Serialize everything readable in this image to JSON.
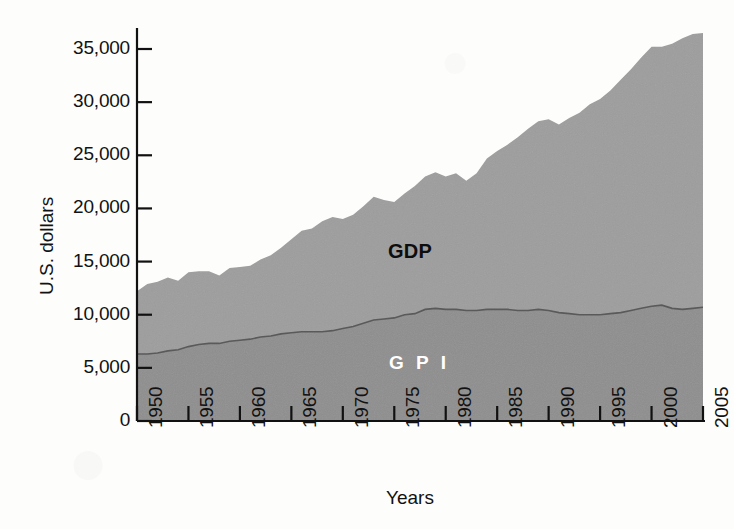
{
  "figure": {
    "background_color": "#fdfdfc",
    "axis_color": "#111111"
  },
  "axes": {
    "y_title": "U.S. dollars",
    "x_title": "Years",
    "y_ticks": [
      "0",
      "5,000",
      "10,000",
      "15,000",
      "20,000",
      "25,000",
      "30,000",
      "35,000"
    ],
    "x_ticks": [
      "1950",
      "1955",
      "1960",
      "1965",
      "1970",
      "1975",
      "1980",
      "1985",
      "1990",
      "1995",
      "2000",
      "2005"
    ]
  },
  "series_labels": {
    "gdp": "GDP",
    "gpi": "G P I"
  },
  "colors": {
    "gdp_band": "#9d9d9d",
    "gpi_band": "#8e8e8e",
    "gpi_line": "#5c5c5c",
    "axis": "#111111",
    "gdp_text": "#0d0d0d",
    "gpi_text": "#ffffff"
  },
  "chart_data": {
    "type": "area",
    "title": "",
    "subtitle": "",
    "xlabel": "Years",
    "ylabel": "U.S. dollars",
    "units": "U.S. dollars per capita",
    "stacked": false,
    "grid": false,
    "legend": "inline-labels",
    "xlim": [
      1950,
      2005
    ],
    "ylim": [
      0,
      36500
    ],
    "y_tick_values": [
      0,
      5000,
      10000,
      15000,
      20000,
      25000,
      30000,
      35000
    ],
    "x_tick_values": [
      1950,
      1955,
      1960,
      1965,
      1970,
      1975,
      1980,
      1985,
      1990,
      1995,
      2000,
      2005
    ],
    "x": [
      1950,
      1951,
      1952,
      1953,
      1954,
      1955,
      1956,
      1957,
      1958,
      1959,
      1960,
      1961,
      1962,
      1963,
      1964,
      1965,
      1966,
      1967,
      1968,
      1969,
      1970,
      1971,
      1972,
      1973,
      1974,
      1975,
      1976,
      1977,
      1978,
      1979,
      1980,
      1981,
      1982,
      1983,
      1984,
      1985,
      1986,
      1987,
      1988,
      1989,
      1990,
      1991,
      1992,
      1993,
      1994,
      1995,
      1996,
      1997,
      1998,
      1999,
      2000,
      2001,
      2002,
      2003,
      2004,
      2005
    ],
    "series": [
      {
        "name": "GDP",
        "label": "GDP",
        "color": "#9d9d9d",
        "values": [
          12200,
          12900,
          13100,
          13500,
          13200,
          14000,
          14100,
          14100,
          13700,
          14400,
          14500,
          14600,
          15200,
          15600,
          16300,
          17100,
          17900,
          18100,
          18800,
          19200,
          19000,
          19400,
          20200,
          21100,
          20800,
          20600,
          21400,
          22100,
          23000,
          23400,
          23000,
          23300,
          22600,
          23300,
          24700,
          25400,
          26000,
          26700,
          27500,
          28200,
          28400,
          27900,
          28500,
          29000,
          29800,
          30300,
          31100,
          32100,
          33100,
          34200,
          35200,
          35200,
          35500,
          36000,
          36400,
          36500
        ]
      },
      {
        "name": "GPI",
        "label": "G P I",
        "color": "#8e8e8e",
        "values": [
          6300,
          6300,
          6400,
          6600,
          6700,
          7000,
          7200,
          7300,
          7300,
          7500,
          7600,
          7700,
          7900,
          8000,
          8200,
          8300,
          8400,
          8400,
          8400,
          8500,
          8700,
          8900,
          9200,
          9500,
          9600,
          9700,
          10000,
          10100,
          10500,
          10600,
          10500,
          10500,
          10400,
          10400,
          10500,
          10500,
          10500,
          10400,
          10400,
          10500,
          10400,
          10200,
          10100,
          10000,
          10000,
          10000,
          10100,
          10200,
          10400,
          10600,
          10800,
          10900,
          10600,
          10500,
          10600,
          10700
        ]
      }
    ],
    "annotations": [
      {
        "text": "GDP",
        "x": 1978,
        "y": 16500,
        "style": "bold-black"
      },
      {
        "text": "G P I",
        "x": 1978,
        "y": 4700,
        "style": "bold-white"
      }
    ]
  }
}
